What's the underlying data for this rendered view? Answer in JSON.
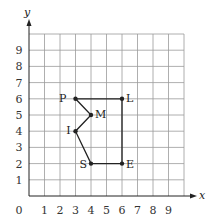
{
  "chart_data": {
    "type": "coordinate-grid",
    "xlabel": "y-axis-label-x",
    "axes": {
      "x_label": "x",
      "y_label": "y",
      "origin_label": "0"
    },
    "x_ticks": [
      "1",
      "2",
      "3",
      "4",
      "5",
      "6",
      "7",
      "8",
      "9"
    ],
    "y_ticks": [
      "1",
      "2",
      "3",
      "4",
      "5",
      "6",
      "7",
      "8",
      "9"
    ],
    "grid": {
      "xmin": 0,
      "xmax": 10,
      "ymin": 0,
      "ymax": 10
    },
    "points": [
      {
        "label": "P",
        "x": 3,
        "y": 6
      },
      {
        "label": "L",
        "x": 6,
        "y": 6
      },
      {
        "label": "E",
        "x": 6,
        "y": 2
      },
      {
        "label": "S",
        "x": 4,
        "y": 2
      },
      {
        "label": "I",
        "x": 3,
        "y": 4
      },
      {
        "label": "M",
        "x": 4,
        "y": 5
      }
    ],
    "polygon_order": [
      "P",
      "L",
      "E",
      "S",
      "I",
      "M",
      "P"
    ]
  },
  "colors": {
    "grid": "#9a9a9a",
    "axis": "#222222",
    "shape": "#222222"
  }
}
